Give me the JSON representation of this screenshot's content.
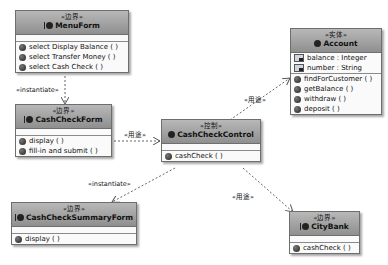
{
  "classes": {
    "menu_form": {
      "stereotype": "«边界»",
      "name": "MenuForm",
      "operations": [
        "select Display Balance ( )",
        "select Transfer Money ( )",
        "select Cash Check ( )"
      ]
    },
    "cash_check_form": {
      "stereotype": "«边界»",
      "name": "CashCheckForm",
      "operations": [
        "display ( )",
        "fill-in and submit ( )"
      ]
    },
    "cash_check_control": {
      "stereotype": "«控制»",
      "name": "CashCheckControl",
      "operations": [
        "cashCheck ( )"
      ]
    },
    "account": {
      "stereotype": "«实体»",
      "name": "Account",
      "attributes": [
        "balance : Integer",
        "number : String"
      ],
      "operations": [
        "findForCustomer ( )",
        "getBalance ( )",
        "withdraw ( )",
        "deposit ( )"
      ]
    },
    "cash_check_summary_form": {
      "stereotype": "«边界»",
      "name": "CashCheckSummaryForm",
      "operations": [
        "display ( )"
      ]
    },
    "city_bank": {
      "stereotype": "«边界»",
      "name": "CityBank",
      "operations": [
        "cashCheck ( )"
      ]
    }
  },
  "edges": {
    "menu_to_form": "«instantiate»",
    "form_to_control": "«用途»",
    "control_to_account": "«用途»",
    "control_to_summary": "«instantiate»",
    "control_to_bank": "«用途»"
  }
}
